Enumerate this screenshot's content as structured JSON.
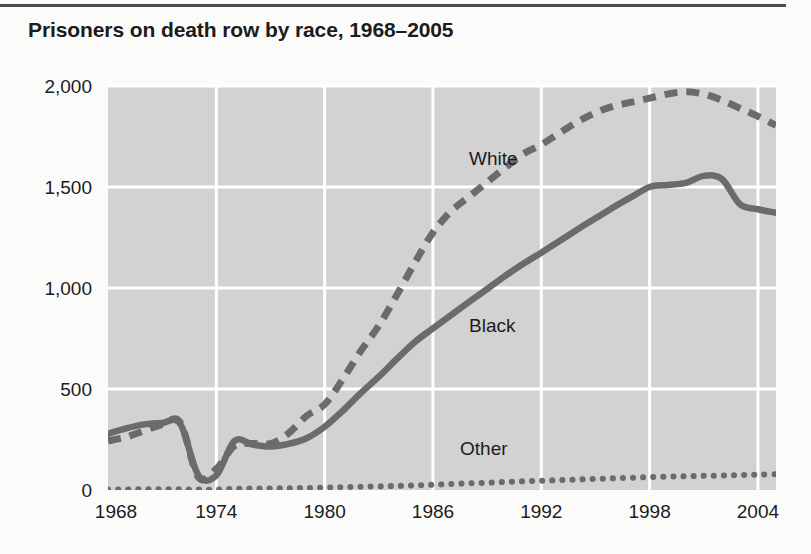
{
  "title": "Prisoners on death row by race, 1968–2005",
  "axis": {
    "y_ticks": [
      "0",
      "500",
      "1,000",
      "1,500",
      "2,000"
    ],
    "y_tick_values": [
      0,
      500,
      1000,
      1500,
      2000
    ],
    "x_ticks": [
      "1968",
      "1974",
      "1980",
      "1986",
      "1992",
      "1998",
      "2004"
    ],
    "x_tick_values": [
      1968,
      1974,
      1980,
      1986,
      1992,
      1998,
      2004
    ]
  },
  "colors": {
    "plot_background": "#d2d2d2",
    "gridline": "#ffffff",
    "line": "#6b6b6b",
    "text": "#1c1c1c",
    "rule": "#4a4a4a"
  },
  "series_labels": {
    "white": "White",
    "black": "Black",
    "other": "Other"
  },
  "chart_data": {
    "type": "line",
    "title": "Prisoners on death row by race, 1968–2005",
    "xlabel": "",
    "ylabel": "",
    "xlim": [
      1968,
      2005
    ],
    "ylim": [
      0,
      2000
    ],
    "grid": true,
    "legend": "inline-labels",
    "x": [
      1968,
      1969,
      1970,
      1971,
      1972,
      1973,
      1974,
      1975,
      1976,
      1977,
      1978,
      1979,
      1980,
      1981,
      1982,
      1983,
      1984,
      1985,
      1986,
      1987,
      1988,
      1989,
      1990,
      1991,
      1992,
      1993,
      1994,
      1995,
      1996,
      1997,
      1998,
      1999,
      2000,
      2001,
      2002,
      2003,
      2004,
      2005
    ],
    "series": [
      {
        "name": "White",
        "style": "dashed",
        "values": [
          243,
          262,
          293,
          324,
          334,
          64,
          104,
          218,
          230,
          229,
          281,
          367,
          424,
          548,
          688,
          813,
          966,
          1126,
          1275,
          1380,
          1452,
          1524,
          1596,
          1664,
          1710,
          1767,
          1822,
          1868,
          1900,
          1920,
          1940,
          1960,
          1972,
          1960,
          1930,
          1890,
          1850,
          1805
        ]
      },
      {
        "name": "Black",
        "style": "solid",
        "values": [
          278,
          305,
          325,
          332,
          328,
          74,
          72,
          243,
          225,
          215,
          228,
          256,
          313,
          392,
          480,
          561,
          649,
          733,
          800,
          866,
          931,
          995,
          1060,
          1120,
          1175,
          1232,
          1290,
          1345,
          1400,
          1451,
          1500,
          1510,
          1520,
          1555,
          1540,
          1415,
          1390,
          1372
        ]
      },
      {
        "name": "Other",
        "style": "dotted",
        "values": [
          3,
          3,
          4,
          4,
          4,
          2,
          2,
          6,
          7,
          8,
          9,
          10,
          12,
          14,
          16,
          18,
          20,
          23,
          26,
          30,
          33,
          36,
          40,
          43,
          46,
          49,
          52,
          55,
          58,
          61,
          64,
          66,
          68,
          70,
          72,
          74,
          76,
          78
        ]
      }
    ],
    "annotations": [
      {
        "text": "White",
        "x": 1988.0,
        "y": 1610
      },
      {
        "text": "Black",
        "x": 1988.0,
        "y": 780
      },
      {
        "text": "Other",
        "x": 1987.5,
        "y": 175
      }
    ]
  }
}
